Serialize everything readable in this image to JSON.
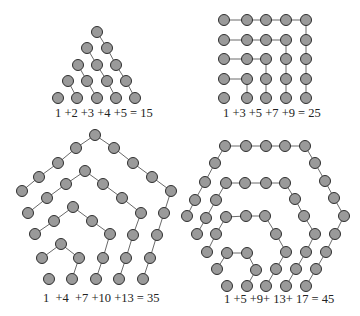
{
  "figures": [
    {
      "name": "triangular-numbers",
      "label": "1 +2 +3 +4 +5 = 15",
      "label_pos": [
        55,
        117
      ],
      "paths": [
        [
          [
            97,
            32
          ],
          [
            107,
            48
          ],
          [
            116,
            65
          ],
          [
            126,
            81
          ],
          [
            135,
            98
          ]
        ],
        [
          [
            87,
            48
          ],
          [
            97,
            65
          ],
          [
            107,
            81
          ],
          [
            116,
            98
          ]
        ],
        [
          [
            78,
            65
          ],
          [
            87,
            81
          ],
          [
            97,
            98
          ]
        ],
        [
          [
            68,
            81
          ],
          [
            77,
            98
          ]
        ]
      ],
      "dots": [
        [
          97,
          32
        ],
        [
          87,
          48
        ],
        [
          107,
          48
        ],
        [
          78,
          65
        ],
        [
          97,
          65
        ],
        [
          116,
          65
        ],
        [
          68,
          81
        ],
        [
          87,
          81
        ],
        [
          107,
          81
        ],
        [
          126,
          81
        ],
        [
          58,
          98
        ],
        [
          77,
          98
        ],
        [
          97,
          98
        ],
        [
          116,
          98
        ],
        [
          135,
          98
        ]
      ]
    },
    {
      "name": "square-numbers",
      "label": "1 +3 +5 +7 +9 = 25",
      "label_pos": [
        223,
        117
      ],
      "paths": [
        [
          [
            224,
            79
          ],
          [
            247,
            79
          ],
          [
            247,
            98
          ]
        ],
        [
          [
            224,
            59
          ],
          [
            266,
            59
          ],
          [
            266,
            98
          ]
        ],
        [
          [
            224,
            40
          ],
          [
            286,
            40
          ],
          [
            286,
            98
          ]
        ],
        [
          [
            224,
            20
          ],
          [
            306,
            20
          ],
          [
            306,
            98
          ]
        ]
      ],
      "dots": [
        [
          224,
          20
        ],
        [
          247,
          20
        ],
        [
          266,
          20
        ],
        [
          286,
          20
        ],
        [
          306,
          20
        ],
        [
          224,
          40
        ],
        [
          247,
          40
        ],
        [
          266,
          40
        ],
        [
          286,
          40
        ],
        [
          306,
          40
        ],
        [
          224,
          59
        ],
        [
          247,
          59
        ],
        [
          266,
          59
        ],
        [
          286,
          59
        ],
        [
          306,
          59
        ],
        [
          224,
          79
        ],
        [
          247,
          79
        ],
        [
          266,
          79
        ],
        [
          286,
          79
        ],
        [
          306,
          79
        ],
        [
          224,
          98
        ],
        [
          247,
          98
        ],
        [
          266,
          98
        ],
        [
          286,
          98
        ],
        [
          306,
          98
        ]
      ]
    },
    {
      "name": "pentagonal-numbers",
      "label": "1  +4  +7 +10 +13 = 35",
      "label_pos": [
        43,
        302
      ],
      "paths": [
        [
          [
            42,
            258
          ],
          [
            61,
            244
          ],
          [
            79,
            258
          ],
          [
            72,
            279
          ]
        ],
        [
          [
            35,
            234
          ],
          [
            54,
            221
          ],
          [
            73,
            207
          ],
          [
            92,
            221
          ],
          [
            110,
            234
          ],
          [
            103,
            258
          ],
          [
            96,
            279
          ]
        ],
        [
          [
            28,
            213
          ],
          [
            47,
            198
          ],
          [
            66,
            184
          ],
          [
            85,
            171
          ],
          [
            103,
            184
          ],
          [
            122,
            198
          ],
          [
            141,
            213
          ],
          [
            133,
            235
          ],
          [
            126,
            258
          ],
          [
            119,
            279
          ]
        ],
        [
          [
            22,
            191
          ],
          [
            39,
            177
          ],
          [
            58,
            163
          ],
          [
            76,
            148
          ],
          [
            95,
            135
          ],
          [
            114,
            148
          ],
          [
            133,
            163
          ],
          [
            152,
            177
          ],
          [
            171,
            191
          ],
          [
            164,
            213
          ],
          [
            157,
            235
          ],
          [
            150,
            258
          ],
          [
            143,
            279
          ]
        ]
      ],
      "dots": [
        [
          49,
          279
        ],
        [
          42,
          258
        ],
        [
          61,
          244
        ],
        [
          79,
          258
        ],
        [
          72,
          279
        ],
        [
          35,
          234
        ],
        [
          54,
          221
        ],
        [
          73,
          207
        ],
        [
          92,
          221
        ],
        [
          110,
          234
        ],
        [
          103,
          258
        ],
        [
          96,
          279
        ],
        [
          28,
          213
        ],
        [
          47,
          198
        ],
        [
          66,
          184
        ],
        [
          85,
          171
        ],
        [
          103,
          184
        ],
        [
          122,
          198
        ],
        [
          141,
          213
        ],
        [
          133,
          235
        ],
        [
          126,
          258
        ],
        [
          119,
          279
        ],
        [
          22,
          191
        ],
        [
          39,
          177
        ],
        [
          58,
          163
        ],
        [
          76,
          148
        ],
        [
          95,
          135
        ],
        [
          114,
          148
        ],
        [
          133,
          163
        ],
        [
          152,
          177
        ],
        [
          171,
          191
        ],
        [
          164,
          213
        ],
        [
          157,
          235
        ],
        [
          150,
          258
        ],
        [
          143,
          279
        ]
      ]
    },
    {
      "name": "hexagonal-numbers",
      "label": "1 +5 +9+ 13+ 17 = 45",
      "label_pos": [
        224,
        303
      ],
      "paths": [
        [
          [
            217,
            269
          ],
          [
            227,
            253
          ],
          [
            247,
            253
          ],
          [
            256,
            270
          ],
          [
            247,
            286
          ]
        ],
        [
          [
            207,
            252
          ],
          [
            216,
            234
          ],
          [
            226,
            217
          ],
          [
            246,
            216
          ],
          [
            265,
            216
          ],
          [
            276,
            234
          ],
          [
            286,
            252
          ],
          [
            276,
            269
          ],
          [
            266,
            286
          ]
        ],
        [
          [
            197,
            234
          ],
          [
            206,
            218
          ],
          [
            216,
            200
          ],
          [
            226,
            183
          ],
          [
            245,
            183
          ],
          [
            266,
            183
          ],
          [
            285,
            183
          ],
          [
            295,
            199
          ],
          [
            304,
            216
          ],
          [
            315,
            234
          ],
          [
            306,
            252
          ],
          [
            296,
            269
          ],
          [
            286,
            286
          ]
        ],
        [
          [
            187,
            216
          ],
          [
            195,
            200
          ],
          [
            205,
            182
          ],
          [
            215,
            163
          ],
          [
            225,
            146
          ],
          [
            246,
            146
          ],
          [
            266,
            146
          ],
          [
            285,
            146
          ],
          [
            305,
            146
          ],
          [
            315,
            163
          ],
          [
            325,
            181
          ],
          [
            334,
            198
          ],
          [
            344,
            216
          ],
          [
            335,
            234
          ],
          [
            326,
            252
          ],
          [
            316,
            269
          ],
          [
            306,
            286
          ]
        ]
      ],
      "dots": [
        [
          227,
          286
        ],
        [
          217,
          269
        ],
        [
          227,
          253
        ],
        [
          247,
          253
        ],
        [
          256,
          270
        ],
        [
          247,
          286
        ],
        [
          207,
          252
        ],
        [
          216,
          234
        ],
        [
          226,
          217
        ],
        [
          246,
          216
        ],
        [
          265,
          216
        ],
        [
          276,
          234
        ],
        [
          286,
          252
        ],
        [
          276,
          269
        ],
        [
          266,
          286
        ],
        [
          197,
          234
        ],
        [
          206,
          218
        ],
        [
          216,
          200
        ],
        [
          226,
          183
        ],
        [
          245,
          183
        ],
        [
          266,
          183
        ],
        [
          285,
          183
        ],
        [
          295,
          199
        ],
        [
          304,
          216
        ],
        [
          315,
          234
        ],
        [
          306,
          252
        ],
        [
          296,
          269
        ],
        [
          286,
          286
        ],
        [
          187,
          216
        ],
        [
          195,
          200
        ],
        [
          205,
          182
        ],
        [
          215,
          163
        ],
        [
          225,
          146
        ],
        [
          246,
          146
        ],
        [
          266,
          146
        ],
        [
          285,
          146
        ],
        [
          305,
          146
        ],
        [
          315,
          163
        ],
        [
          325,
          181
        ],
        [
          334,
          198
        ],
        [
          344,
          216
        ],
        [
          335,
          234
        ],
        [
          326,
          252
        ],
        [
          316,
          269
        ],
        [
          306,
          286
        ]
      ]
    }
  ],
  "style": {
    "dot_fill": "#9a9a9a",
    "dot_stroke": "#2e2e2e",
    "line_color": "#6a6a6a",
    "dot_radius": 5.5
  }
}
